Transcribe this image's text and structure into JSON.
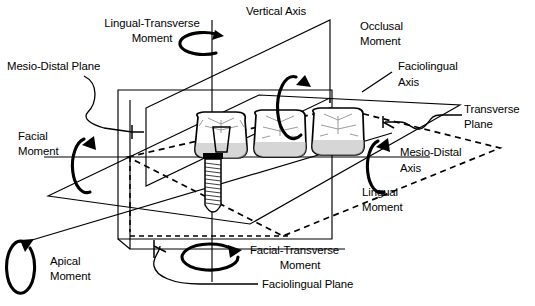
{
  "figure": {
    "background_color": "#ffffff",
    "line_color": "#000000",
    "shade_color": "#bdbdbd"
  },
  "labels": {
    "vertical_axis": "Vertical Axis",
    "lingual_transverse_moment_line1": "Lingual-Transverse",
    "lingual_transverse_moment_line2": "Moment",
    "mesio_distal_plane": "Mesio-Distal Plane",
    "facial_moment_line1": "Facial",
    "facial_moment_line2": "Moment",
    "apical_moment_line1": "Apical",
    "apical_moment_line2": "Moment",
    "occlusal_moment_line1": "Occlusal",
    "occlusal_moment_line2": "Moment",
    "faciolingual_axis_line1": "Faciolingual",
    "faciolingual_axis_line2": "Axis",
    "transverse_plane_line1": "Transverse",
    "transverse_plane_line2": "Plane",
    "mesio_distal_axis_line1": "Mesio-Distal",
    "mesio_distal_axis_line2": "Axis",
    "lingual_moment_line1": "Lingual",
    "lingual_moment_line2": "Moment",
    "facial_transverse_moment_line1": "Facial-Transverse",
    "facial_transverse_moment_line2": "Moment",
    "faciolingual_plane": "Faciolingual Plane"
  },
  "axes": [
    {
      "name": "vertical-axis",
      "label": "Vertical Axis",
      "orientation": "vertical"
    },
    {
      "name": "faciolingual-axis",
      "label": "Faciolingual Axis",
      "orientation": "oblique-right"
    },
    {
      "name": "mesio-distal-axis",
      "label": "Mesio-Distal Axis",
      "orientation": "horizontal"
    }
  ],
  "planes": [
    {
      "name": "mesio-distal-plane",
      "label": "Mesio-Distal Plane"
    },
    {
      "name": "transverse-plane",
      "label": "Transverse Plane"
    },
    {
      "name": "faciolingual-plane",
      "label": "Faciolingual Plane"
    }
  ],
  "moments": [
    {
      "name": "lingual-transverse-moment",
      "label": "Lingual-Transverse Moment",
      "about_axis": "vertical-axis"
    },
    {
      "name": "occlusal-moment",
      "label": "Occlusal Moment",
      "about_axis": "vertical-axis"
    },
    {
      "name": "facial-moment",
      "label": "Facial Moment",
      "about_axis": "mesio-distal-axis"
    },
    {
      "name": "lingual-moment",
      "label": "Lingual Moment",
      "about_axis": "mesio-distal-axis"
    },
    {
      "name": "apical-moment",
      "label": "Apical Moment",
      "about_axis": "faciolingual-axis"
    },
    {
      "name": "facial-transverse-moment",
      "label": "Facial-Transverse Moment",
      "about_axis": "faciolingual-axis"
    }
  ],
  "anatomy": {
    "teeth_count": 3,
    "implant": "endosseous threaded implant fixture",
    "abutment": "implant abutment beneath first crown"
  }
}
